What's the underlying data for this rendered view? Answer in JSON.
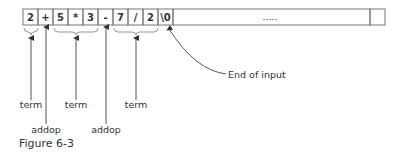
{
  "cells": [
    {
      "text": "2"
    },
    {
      "text": "+"
    },
    {
      "text": "5"
    },
    {
      "text": "*"
    },
    {
      "text": "3"
    },
    {
      "text": "-"
    },
    {
      "text": "7"
    },
    {
      "text": "/"
    },
    {
      "text": "2"
    },
    {
      "text": "\\0"
    }
  ],
  "ellipsis_cell": ".....",
  "annotations": [
    {
      "label": "term",
      "target": "2"
    },
    {
      "label": "addop",
      "target": "+"
    },
    {
      "label": "term",
      "target": "5 * 3"
    },
    {
      "label": "addop",
      "target": "-"
    },
    {
      "label": "term",
      "target": "7 / 2"
    }
  ],
  "end_label": "End of input",
  "caption": "Figure 6-3",
  "colors": {
    "stroke": "#777777",
    "text": "#333333"
  }
}
